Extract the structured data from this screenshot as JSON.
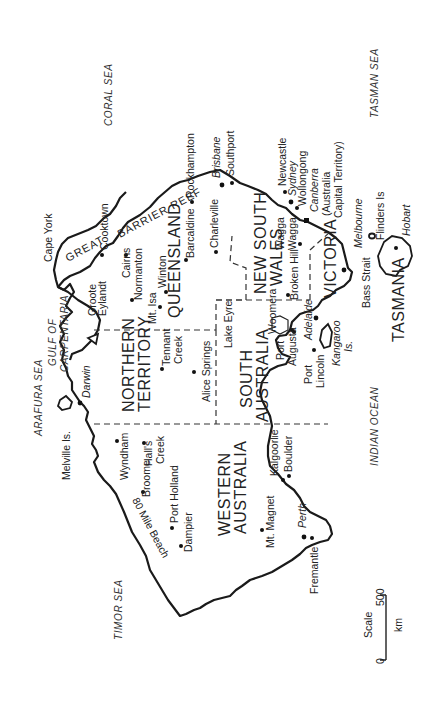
{
  "map": {
    "title": "Australia",
    "orientation_note": "rotated 90 degrees counter-clockwise",
    "states": [
      {
        "id": "wa",
        "label_line1": "WESTERN",
        "label_line2": "AUSTRALIA"
      },
      {
        "id": "nt",
        "label_line1": "NORTHERN",
        "label_line2": "TERRITORY"
      },
      {
        "id": "sa",
        "label_line1": "SOUTH",
        "label_line2": "AUSTRALIA"
      },
      {
        "id": "qld",
        "label_line1": "QUEENSLAND",
        "label_line2": ""
      },
      {
        "id": "nsw",
        "label_line1": "NEW SOUTH",
        "label_line2": "WALES"
      },
      {
        "id": "vic",
        "label_line1": "VICTORIA",
        "label_line2": ""
      },
      {
        "id": "tas",
        "label_line1": "TASMANIA",
        "label_line2": ""
      }
    ],
    "seas": {
      "coral": "CORAL SEA",
      "tasman": "TASMAN SEA",
      "arafura": "ARAFURA SEA",
      "timor": "TIMOR SEA",
      "indian": "INDIAN OCEAN",
      "gulf_line1": "GULF OF",
      "gulf_line2": "CARPENTARIA"
    },
    "features": {
      "reef_great": "GREAT",
      "reef_barrier": "BARRIER REEF",
      "cape_york": "Cape York",
      "groote_line1": "Groote",
      "groote_line2": "Eylandt",
      "melville": "Melville Is.",
      "eighty_mile": "80 Mile Beach",
      "lake_eyre": "Lake Eyre",
      "kangaroo_line1": "Kangaroo",
      "kangaroo_line2": "Is.",
      "bass_strait": "Bass Strait",
      "flinders": "Flinders Is"
    },
    "cities": {
      "cooktown": "Cooktown",
      "cairns": "Cairns",
      "normanton": "Normanton",
      "mt_isa": "Mt. Isa",
      "winton": "Winton",
      "barcaldine": "Barcaldine",
      "rockhampton": "Rockhampton",
      "charleville": "Charleville",
      "brisbane": "Brisbane",
      "southport": "Southport",
      "newcastle": "Newcastle",
      "sydney": "Sydney",
      "wollongong": "Wollongong",
      "canberra": "Canberra",
      "act_line1": "(Australia",
      "act_line2": "Capital Territory)",
      "wagga_line1": "Wagga",
      "wagga_line2": "Wagga",
      "broken_hill": "Broken Hill",
      "melbourne": "Melbourne",
      "hobart": "Hobart",
      "adelaide": "Adelaide",
      "woomera": "Woomera",
      "port_augusta_line1": "Port",
      "port_augusta_line2": "Augusta",
      "port_lincoln_line1": "Port",
      "port_lincoln_line2": "Lincoln",
      "darwin": "Darwin",
      "tennant_line1": "Tennant",
      "tennant_line2": "Creek",
      "alice_springs": "Alice Springs",
      "wyndham": "Wyndham",
      "halls_line1": "Hall's",
      "halls_line2": "Creek",
      "broome": "Broome",
      "port_hedland": "Port Holland",
      "dampier": "Dampier",
      "kalgoorlie": "Kalgoorlie",
      "boulder": "Boulder",
      "mt_magnet": "Mt. Magnet",
      "perth": "Perth",
      "fremantle": "Fremantle"
    },
    "scale": {
      "label": "Scale",
      "unit": "km",
      "min": "0",
      "max": "500"
    }
  }
}
